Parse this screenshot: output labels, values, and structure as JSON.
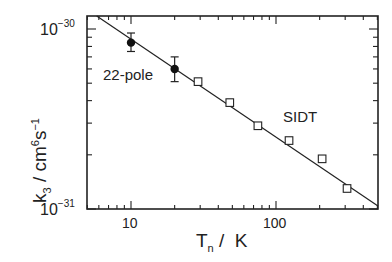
{
  "chart_data": {
    "type": "scatter",
    "title": "",
    "xlabel": "T_n / K",
    "ylabel": "k_3 / cm^6 s^-1",
    "xscale": "log",
    "yscale": "log",
    "xlim": [
      5,
      500
    ],
    "ylim": [
      1e-31,
      1.18e-30
    ],
    "x_tick_labels": [
      "10",
      "100"
    ],
    "x_ticks": [
      10,
      100
    ],
    "y_tick_labels": [
      "10^-30",
      "10^-31"
    ],
    "y_ticks": [
      1e-30,
      1e-31
    ],
    "grid": false,
    "legend": null,
    "annotations": [
      {
        "text": "22-pole",
        "x": 5.9,
        "y": 6.1e-31
      },
      {
        "text": "SIDT",
        "x": 150,
        "y": 3.2e-31
      }
    ],
    "series": [
      {
        "name": "22-pole",
        "marker": "filled-circle",
        "x": [
          10,
          20
        ],
        "y": [
          8.4e-31,
          6e-31
        ],
        "yerr_low": [
          7.5e-31,
          5.1e-31
        ],
        "yerr_high": [
          9.5e-31,
          7e-31
        ]
      },
      {
        "name": "SIDT",
        "marker": "open-square",
        "x": [
          29,
          48,
          75,
          123,
          208,
          309
        ],
        "y": [
          5.1e-31,
          3.9e-31,
          2.9e-31,
          2.4e-31,
          1.9e-31,
          1.3e-31
        ]
      },
      {
        "name": "fit",
        "style": "line",
        "x": [
          5.8,
          505
        ],
        "y": [
          1.18e-30,
          1.04e-31
        ]
      }
    ]
  },
  "labels": {
    "ylabel_main": "k",
    "ylabel_sub": "3",
    "ylabel_sep": " / ",
    "ylabel_unit": "cm",
    "ylabel_exp1": "6",
    "ylabel_unit2": "s",
    "ylabel_exp2": "−1",
    "xlabel_main": "T",
    "xlabel_sub": "n",
    "xlabel_unit": " /  K",
    "ytick_top_base": "10",
    "ytick_top_exp": "−30",
    "ytick_bot_base": "10",
    "ytick_bot_exp": "−31",
    "xtick_10": "10",
    "xtick_100": "100",
    "anno_22pole": "22-pole",
    "anno_sidt": "SIDT"
  }
}
